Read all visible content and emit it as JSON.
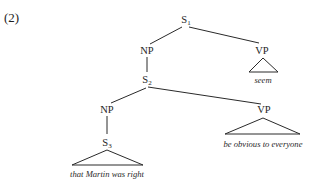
{
  "example": {
    "number": "(2)"
  },
  "tree": {
    "nodes": {
      "s1": {
        "category": "S",
        "index": "1"
      },
      "np1": {
        "category": "NP"
      },
      "vp1": {
        "category": "VP"
      },
      "s2": {
        "category": "S",
        "index": "2"
      },
      "np2": {
        "category": "NP"
      },
      "vp2": {
        "category": "VP"
      },
      "s3": {
        "category": "S",
        "index": "3"
      }
    },
    "leaves": {
      "vp1": "seem",
      "s3": "that Martin was right",
      "vp2": "be obvious to everyone"
    },
    "structure": [
      {
        "parent": "S1",
        "children": [
          "NP",
          "VP"
        ]
      },
      {
        "parent": "NP",
        "children": [
          "S2"
        ]
      },
      {
        "parent": "VP",
        "children": [
          "seem"
        ],
        "collapsed": true
      },
      {
        "parent": "S2",
        "children": [
          "NP",
          "VP"
        ]
      },
      {
        "parent": "NP",
        "children": [
          "S3"
        ]
      },
      {
        "parent": "S3",
        "children": [
          "that Martin was right"
        ],
        "collapsed": true
      },
      {
        "parent": "VP",
        "children": [
          "be obvious to everyone"
        ],
        "collapsed": true
      }
    ]
  }
}
